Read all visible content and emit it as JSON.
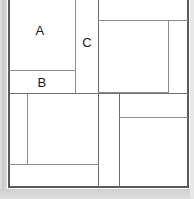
{
  "figure": {
    "type": "rectangle-partition-diagram",
    "width": 194,
    "height": 199,
    "background_color": "#ffffff",
    "line_color": "#6e6e6e",
    "frame_color": "#5a5a5a",
    "label_color": "#1a1a1a",
    "page_tint_color": "#cfcfcf"
  },
  "labels": [
    {
      "text": "A",
      "x": 40,
      "y": 30
    },
    {
      "text": "B",
      "x": 42,
      "y": 82
    },
    {
      "text": "C",
      "x": 87,
      "y": 42
    }
  ],
  "regions": [
    {
      "name": "region-a",
      "label": "A",
      "x": 9,
      "y": -6,
      "w": 66,
      "h": 76
    },
    {
      "name": "region-b",
      "label": "B",
      "x": 9,
      "y": 70,
      "w": 66,
      "h": 23
    },
    {
      "name": "region-c",
      "label": "C",
      "x": 75,
      "y": -6,
      "w": 23,
      "h": 99
    },
    {
      "name": "region-top-right",
      "label": "",
      "x": 98,
      "y": -6,
      "w": 89,
      "h": 26
    },
    {
      "name": "region-right-main",
      "label": "",
      "x": 98,
      "y": 20,
      "w": 70,
      "h": 73
    },
    {
      "name": "region-right-narrow",
      "label": "",
      "x": 168,
      "y": 20,
      "w": 19,
      "h": 73
    },
    {
      "name": "region-lower-left-narrow",
      "label": "",
      "x": 9,
      "y": 93,
      "w": 18,
      "h": 71
    },
    {
      "name": "region-lower-left-main",
      "label": "",
      "x": 27,
      "y": 93,
      "w": 71,
      "h": 71
    },
    {
      "name": "region-lower-left-bottom",
      "label": "",
      "x": 9,
      "y": 164,
      "w": 89,
      "h": 22
    },
    {
      "name": "region-lower-mid-column",
      "label": "",
      "x": 98,
      "y": 93,
      "w": 21,
      "h": 93
    },
    {
      "name": "region-lower-right-top",
      "label": "",
      "x": 119,
      "y": 93,
      "w": 68,
      "h": 24
    },
    {
      "name": "region-lower-right-main",
      "label": "",
      "x": 119,
      "y": 117,
      "w": 68,
      "h": 69
    }
  ],
  "lines": {
    "horizontal": [
      {
        "name": "frame-bottom",
        "x": 8,
        "y": 186,
        "w": 180
      },
      {
        "name": "divider-a-b",
        "x": 9,
        "y": 70,
        "w": 66
      },
      {
        "name": "divider-b-bottom",
        "x": 9,
        "y": 93,
        "w": 178
      },
      {
        "name": "divider-top-right",
        "x": 98,
        "y": 20,
        "w": 89
      },
      {
        "name": "divider-right-main-base",
        "x": 98,
        "y": 92,
        "w": 70
      },
      {
        "name": "divider-lower-right-top",
        "x": 119,
        "y": 117,
        "w": 68
      },
      {
        "name": "divider-lower-left-base",
        "x": 9,
        "y": 164,
        "w": 89
      }
    ],
    "vertical": [
      {
        "name": "frame-left",
        "x": 8,
        "y": -6,
        "h": 193
      },
      {
        "name": "frame-right",
        "x": 187,
        "y": -6,
        "h": 193
      },
      {
        "name": "divider-ab-c",
        "x": 75,
        "y": -6,
        "h": 99
      },
      {
        "name": "divider-c-right",
        "x": 98,
        "y": -6,
        "h": 193
      },
      {
        "name": "divider-right-narrow",
        "x": 168,
        "y": 20,
        "h": 73
      },
      {
        "name": "divider-lower-left-inner",
        "x": 27,
        "y": 93,
        "h": 71
      },
      {
        "name": "divider-lower-mid",
        "x": 119,
        "y": 93,
        "h": 93
      }
    ]
  }
}
